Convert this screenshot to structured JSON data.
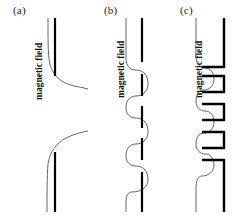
{
  "figure": {
    "background_color": "#ffffff",
    "curve_color": "#4a4a4a",
    "bar_color": "#000000",
    "width": 252,
    "height": 220
  },
  "panels": [
    {
      "id": "a",
      "label": "(a)",
      "axis_label": "magnetic field",
      "description": "single smooth sigmoid step profile with two long vertical bars",
      "curve": {
        "type": "sigmoid-step",
        "oscillation_count": 1
      },
      "bars": [
        {
          "kind": "vertical-bar",
          "x": 55,
          "y1": 18,
          "y2": 76
        },
        {
          "kind": "vertical-bar",
          "x": 55,
          "y1": 152,
          "y2": 212
        }
      ]
    },
    {
      "id": "b",
      "label": "(b)",
      "axis_label": "magnetic field",
      "description": "four-period oscillating profile with dashed vertical segments",
      "curve": {
        "type": "oscillating",
        "oscillation_count": 4
      },
      "bars": [
        {
          "kind": "vertical-bar",
          "x": 54,
          "y1": 18,
          "y2": 62
        },
        {
          "kind": "vertical-bar",
          "x": 54,
          "y1": 72,
          "y2": 96
        },
        {
          "kind": "vertical-bar",
          "x": 54,
          "y1": 104,
          "y2": 128
        },
        {
          "kind": "vertical-bar",
          "x": 54,
          "y1": 136,
          "y2": 160
        },
        {
          "kind": "vertical-bar",
          "x": 54,
          "y1": 170,
          "y2": 212
        }
      ]
    },
    {
      "id": "c",
      "label": "(c)",
      "axis_label": "magnetic field",
      "description": "five-period oscillating profile with C-shaped open rectangular brackets",
      "curve": {
        "type": "oscillating",
        "oscillation_count": 5
      },
      "bars": [
        {
          "kind": "bracket-open-left",
          "x1": 32,
          "x2": 54,
          "y1": 18,
          "y2": 67
        },
        {
          "kind": "bracket-open-left",
          "x1": 32,
          "x2": 54,
          "y1": 76,
          "y2": 92
        },
        {
          "kind": "bracket-open-left",
          "x1": 32,
          "x2": 54,
          "y1": 104,
          "y2": 120
        },
        {
          "kind": "bracket-open-left",
          "x1": 32,
          "x2": 54,
          "y1": 132,
          "y2": 148
        },
        {
          "kind": "bracket-open-left",
          "x1": 32,
          "x2": 54,
          "y1": 160,
          "y2": 212
        }
      ]
    }
  ]
}
